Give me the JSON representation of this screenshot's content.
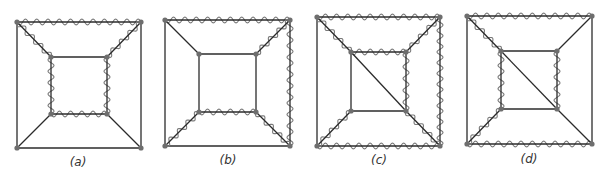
{
  "figure": {
    "panels": [
      {
        "id": "a",
        "label": "(a)",
        "label_pos": [
          78,
          166
        ],
        "outer": {
          "tl": [
            17,
            22
          ],
          "tr": [
            141,
            22
          ],
          "br": [
            141,
            148
          ],
          "bl": [
            17,
            148
          ]
        },
        "inner": {
          "tl": [
            51,
            57
          ],
          "tr": [
            107,
            57
          ],
          "br": [
            107,
            114
          ],
          "bl": [
            51,
            114
          ]
        },
        "inner_diagonal": false,
        "wavy_edges": [
          "outer_top",
          "diag_tl",
          "diag_tr",
          "inner_left",
          "inner_right",
          "inner_bottom"
        ]
      },
      {
        "id": "b",
        "label": "(b)",
        "label_pos": [
          228,
          164
        ],
        "outer": {
          "tl": [
            165,
            20
          ],
          "tr": [
            290,
            20
          ],
          "br": [
            290,
            146
          ],
          "bl": [
            165,
            146
          ]
        },
        "inner": {
          "tl": [
            199,
            54
          ],
          "tr": [
            256,
            54
          ],
          "br": [
            256,
            112
          ],
          "bl": [
            199,
            112
          ]
        },
        "inner_diagonal": false,
        "wavy_edges": [
          "outer_top",
          "outer_right",
          "diag_tr",
          "diag_bl",
          "diag_br",
          "inner_bottom"
        ]
      },
      {
        "id": "c",
        "label": "(c)",
        "label_pos": [
          379,
          164
        ],
        "outer": {
          "tl": [
            317,
            17
          ],
          "tr": [
            440,
            17
          ],
          "br": [
            440,
            146
          ],
          "bl": [
            317,
            146
          ]
        },
        "inner": {
          "tl": [
            351,
            52
          ],
          "tr": [
            406,
            52
          ],
          "br": [
            406,
            111
          ],
          "bl": [
            351,
            111
          ]
        },
        "inner_diagonal": true,
        "wavy_edges": [
          "outer_top",
          "outer_right",
          "outer_bottom",
          "diag_tl",
          "diag_tr",
          "diag_bl",
          "diag_br",
          "inner_top",
          "inner_right"
        ]
      },
      {
        "id": "d",
        "label": "(d)",
        "label_pos": [
          529,
          163
        ],
        "outer": {
          "tl": [
            467,
            16
          ],
          "tr": [
            592,
            16
          ],
          "br": [
            592,
            144
          ],
          "bl": [
            467,
            144
          ]
        },
        "inner": {
          "tl": [
            501,
            51
          ],
          "tr": [
            557,
            51
          ],
          "br": [
            557,
            109
          ],
          "bl": [
            501,
            109
          ]
        },
        "inner_diagonal": true,
        "wavy_edges": [
          "outer_top",
          "outer_bottom",
          "diag_tl",
          "diag_bl",
          "inner_left",
          "inner_right"
        ]
      }
    ],
    "style": {
      "edge_color": "#2b2b2b",
      "wave_color": "#7a7a7a",
      "vertex_color": "#6e6e6e",
      "wave_wavelength": 11,
      "wave_amplitude": 3
    }
  }
}
